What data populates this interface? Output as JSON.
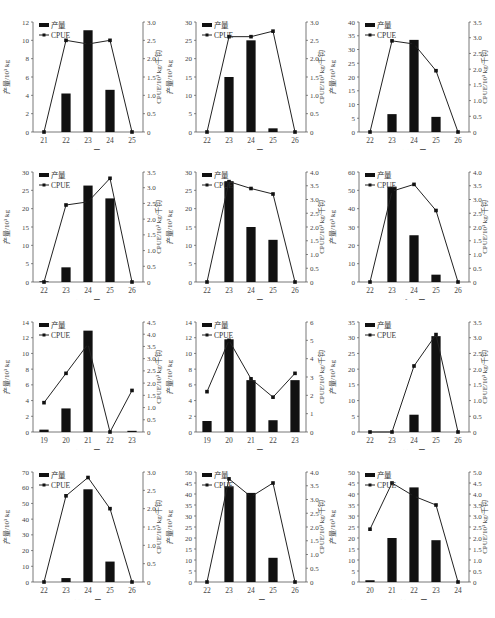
{
  "figure": {
    "left_axis_label": "产量/10³ kg",
    "right_axis_label": "CPUE/10³ kg/千钩",
    "legend": {
      "bar": "产量",
      "line": "CPUE"
    },
    "caption": ""
  },
  "chart_data": [
    {
      "type": "bar+line",
      "panel": "(a)",
      "title": "(a) 1月",
      "categories": [
        "21",
        "22",
        "23",
        "24",
        "25"
      ],
      "series": [
        {
          "name": "产量",
          "type": "bar",
          "axis": "left",
          "values": [
            0,
            4.2,
            11.1,
            4.6,
            0
          ]
        },
        {
          "name": "CPUE",
          "type": "line",
          "axis": "right",
          "values": [
            0,
            2.5,
            2.4,
            2.5,
            0
          ]
        }
      ],
      "ylim_left": [
        0,
        12
      ],
      "yticks_left": [
        0,
        2,
        4,
        6,
        8,
        10,
        12
      ],
      "ylim_right": [
        0,
        3.0
      ],
      "yticks_right": [
        0,
        0.5,
        1.0,
        1.5,
        2.0,
        2.5,
        3.0
      ],
      "ylabel_left": "产量/10³ kg",
      "ylabel_right": "CPUE/10³ kg/千钩"
    },
    {
      "type": "bar+line",
      "panel": "(b)",
      "title": "(b) 2月",
      "categories": [
        "22",
        "23",
        "24",
        "25",
        "26"
      ],
      "series": [
        {
          "name": "产量",
          "type": "bar",
          "axis": "left",
          "values": [
            0,
            15,
            25,
            1,
            0
          ]
        },
        {
          "name": "CPUE",
          "type": "line",
          "axis": "right",
          "values": [
            0,
            2.6,
            2.6,
            2.75,
            0
          ]
        }
      ],
      "ylim_left": [
        0,
        30
      ],
      "yticks_left": [
        0,
        5,
        10,
        15,
        20,
        25,
        30
      ],
      "ylim_right": [
        0,
        3.0
      ],
      "yticks_right": [
        0,
        0.5,
        1.0,
        1.5,
        2.0,
        2.5,
        3.0
      ],
      "ylabel_left": "产量/10³ kg",
      "ylabel_right": "CPUE/10³ kg/千钩"
    },
    {
      "type": "bar+line",
      "panel": "(c)",
      "title": "(c) 3月",
      "categories": [
        "22",
        "23",
        "24",
        "25",
        "26"
      ],
      "series": [
        {
          "name": "产量",
          "type": "bar",
          "axis": "left",
          "values": [
            0,
            6.5,
            33.5,
            5.5,
            0
          ]
        },
        {
          "name": "CPUE",
          "type": "line",
          "axis": "right",
          "values": [
            0,
            2.9,
            2.8,
            1.95,
            0
          ]
        }
      ],
      "ylim_left": [
        0,
        40
      ],
      "yticks_left": [
        0,
        5,
        10,
        15,
        20,
        25,
        30,
        35,
        40
      ],
      "ylim_right": [
        0,
        3.5
      ],
      "yticks_right": [
        0,
        0.5,
        1.0,
        1.5,
        2.0,
        2.5,
        3.0,
        3.5
      ],
      "ylabel_left": "产量/10³ kg",
      "ylabel_right": "CPUE/10³ kg/千钩"
    },
    {
      "type": "bar+line",
      "panel": "(d)",
      "title": "(d) 4月",
      "categories": [
        "22",
        "23",
        "24",
        "25",
        "26"
      ],
      "series": [
        {
          "name": "产量",
          "type": "bar",
          "axis": "left",
          "values": [
            0.2,
            4,
            26.3,
            22.8,
            0
          ]
        },
        {
          "name": "CPUE",
          "type": "line",
          "axis": "right",
          "values": [
            0,
            2.45,
            2.55,
            3.3,
            0
          ]
        }
      ],
      "ylim_left": [
        0,
        30
      ],
      "yticks_left": [
        0,
        5,
        10,
        15,
        20,
        25,
        30
      ],
      "ylim_right": [
        0,
        3.5
      ],
      "yticks_right": [
        0,
        0.5,
        1.0,
        1.5,
        2.0,
        2.5,
        3.0,
        3.5
      ],
      "ylabel_left": "产量/10³ kg",
      "ylabel_right": "CPUE/10³ kg/千钩"
    },
    {
      "type": "bar+line",
      "panel": "(e)",
      "title": "(e) 5月",
      "categories": [
        "22",
        "23",
        "24",
        "25",
        "26"
      ],
      "series": [
        {
          "name": "产量",
          "type": "bar",
          "axis": "left",
          "values": [
            0,
            27.5,
            15,
            11.5,
            0
          ]
        },
        {
          "name": "CPUE",
          "type": "line",
          "axis": "right",
          "values": [
            0,
            3.65,
            3.4,
            3.2,
            0
          ]
        }
      ],
      "ylim_left": [
        0,
        30
      ],
      "yticks_left": [
        0,
        5,
        10,
        15,
        20,
        25,
        30
      ],
      "ylim_right": [
        0,
        4.0
      ],
      "yticks_right": [
        0,
        0.5,
        1.0,
        1.5,
        2.0,
        2.5,
        3.0,
        3.5,
        4.0
      ],
      "ylabel_left": "产量/10³ kg",
      "ylabel_right": "CPUE/10³ kg/千钩"
    },
    {
      "type": "bar+line",
      "panel": "(f)",
      "title": "(f) 6月",
      "categories": [
        "22",
        "23",
        "24",
        "25",
        "26"
      ],
      "series": [
        {
          "name": "产量",
          "type": "bar",
          "axis": "left",
          "values": [
            0,
            52,
            25.5,
            4,
            0
          ]
        },
        {
          "name": "CPUE",
          "type": "line",
          "axis": "right",
          "values": [
            0,
            3.3,
            3.55,
            2.6,
            0
          ]
        }
      ],
      "ylim_left": [
        0,
        60
      ],
      "yticks_left": [
        0,
        10,
        20,
        30,
        40,
        50,
        60
      ],
      "ylim_right": [
        0,
        4.0
      ],
      "yticks_right": [
        0,
        0.5,
        1.0,
        1.5,
        2.0,
        2.5,
        3.0,
        3.5,
        4.0
      ],
      "ylabel_left": "产量/10³ kg",
      "ylabel_right": "CPUE/10³ kg/千钩"
    },
    {
      "type": "bar+line",
      "panel": "(g)",
      "title": "(g) 7月",
      "categories": [
        "19",
        "20",
        "21",
        "22",
        "23"
      ],
      "series": [
        {
          "name": "产量",
          "type": "bar",
          "axis": "left",
          "values": [
            0.3,
            3,
            12.9,
            0,
            0.15
          ]
        },
        {
          "name": "CPUE",
          "type": "line",
          "axis": "right",
          "values": [
            1.2,
            2.4,
            3.6,
            0,
            1.7
          ]
        }
      ],
      "ylim_left": [
        0,
        14
      ],
      "yticks_left": [
        0,
        2,
        4,
        6,
        8,
        10,
        12,
        14
      ],
      "ylim_right": [
        0,
        4.5
      ],
      "yticks_right": [
        0,
        0.5,
        1.0,
        1.5,
        2.0,
        2.5,
        3.0,
        3.5,
        4.0,
        4.5
      ],
      "ylabel_left": "产量/10³ kg",
      "ylabel_right": "CPUE/10³ kg/千钩"
    },
    {
      "type": "bar+line",
      "panel": "(h)",
      "title": "(h) 8月",
      "categories": [
        "19",
        "20",
        "21",
        "22",
        "23"
      ],
      "series": [
        {
          "name": "产量",
          "type": "bar",
          "axis": "left",
          "values": [
            1.4,
            11.8,
            6.6,
            1.5,
            6.6
          ]
        },
        {
          "name": "CPUE",
          "type": "line",
          "axis": "right",
          "values": [
            2.2,
            5.0,
            2.9,
            1.9,
            3.2
          ]
        }
      ],
      "ylim_left": [
        0,
        14
      ],
      "yticks_left": [
        0,
        2,
        4,
        6,
        8,
        10,
        12,
        14
      ],
      "ylim_right": [
        0,
        6
      ],
      "yticks_right": [
        0,
        1,
        2,
        3,
        4,
        5,
        6
      ],
      "ylabel_left": "产量/10³ kg",
      "ylabel_right": "CPUE/10³ kg/千钩"
    },
    {
      "type": "bar+line",
      "panel": "(i)",
      "title": "(i) 9月",
      "categories": [
        "22",
        "23",
        "24",
        "25",
        "26"
      ],
      "series": [
        {
          "name": "产量",
          "type": "bar",
          "axis": "left",
          "values": [
            0,
            0,
            5.5,
            30.5,
            0
          ]
        },
        {
          "name": "CPUE",
          "type": "line",
          "axis": "right",
          "values": [
            0,
            0,
            2.1,
            3.1,
            0
          ]
        }
      ],
      "ylim_left": [
        0,
        35
      ],
      "yticks_left": [
        0,
        5,
        10,
        15,
        20,
        25,
        30,
        35
      ],
      "ylim_right": [
        0,
        3.5
      ],
      "yticks_right": [
        0,
        0.5,
        1.0,
        1.5,
        2.0,
        2.5,
        3.0,
        3.5
      ],
      "ylabel_left": "产量/10³ kg",
      "ylabel_right": "CPUE/10³ kg/千钩"
    },
    {
      "type": "bar+line",
      "panel": "(j)",
      "title": "(j) 10月",
      "categories": [
        "22",
        "23",
        "24",
        "25",
        "26"
      ],
      "series": [
        {
          "name": "产量",
          "type": "bar",
          "axis": "left",
          "values": [
            0,
            2.5,
            59,
            13,
            0
          ]
        },
        {
          "name": "CPUE",
          "type": "line",
          "axis": "right",
          "values": [
            0,
            2.35,
            2.85,
            2.0,
            0
          ]
        }
      ],
      "ylim_left": [
        0,
        70
      ],
      "yticks_left": [
        0,
        10,
        20,
        30,
        40,
        50,
        60,
        70
      ],
      "ylim_right": [
        0,
        3.0
      ],
      "yticks_right": [
        0,
        0.5,
        1.0,
        1.5,
        2.0,
        2.5,
        3.0
      ],
      "ylabel_left": "产量/10³ kg",
      "ylabel_right": "CPUE/10³ kg/千钩"
    },
    {
      "type": "bar+line",
      "panel": "(k)",
      "title": "(k) 11月",
      "categories": [
        "22",
        "23",
        "24",
        "25",
        "26"
      ],
      "series": [
        {
          "name": "产量",
          "type": "bar",
          "axis": "left",
          "values": [
            0,
            43.5,
            40.5,
            11,
            0
          ]
        },
        {
          "name": "CPUE",
          "type": "line",
          "axis": "right",
          "values": [
            0,
            3.75,
            3.1,
            3.6,
            0
          ]
        }
      ],
      "ylim_left": [
        0,
        50
      ],
      "yticks_left": [
        0,
        5,
        10,
        15,
        20,
        25,
        30,
        35,
        40,
        45,
        50
      ],
      "ylim_right": [
        0,
        4.0
      ],
      "yticks_right": [
        0,
        0.5,
        1.0,
        1.5,
        2.0,
        2.5,
        3.0,
        3.5,
        4.0
      ],
      "ylabel_left": "产量/10³ kg",
      "ylabel_right": "CPUE/10³ kg/千钩"
    },
    {
      "type": "bar+line",
      "panel": "(l)",
      "title": "(l) 12月",
      "categories": [
        "20",
        "21",
        "22",
        "23",
        "24"
      ],
      "series": [
        {
          "name": "产量",
          "type": "bar",
          "axis": "left",
          "values": [
            0.8,
            20,
            43,
            19,
            0
          ]
        },
        {
          "name": "CPUE",
          "type": "line",
          "axis": "right",
          "values": [
            2.4,
            4.5,
            3.9,
            3.5,
            0
          ]
        }
      ],
      "ylim_left": [
        0,
        50
      ],
      "yticks_left": [
        0,
        5,
        10,
        15,
        20,
        25,
        30,
        35,
        40,
        45,
        50
      ],
      "ylim_right": [
        0,
        5.0
      ],
      "yticks_right": [
        0,
        0.5,
        1.0,
        1.5,
        2.0,
        2.5,
        3.0,
        3.5,
        4.0,
        4.5,
        5.0
      ],
      "ylabel_left": "产量/10³ kg",
      "ylabel_right": "CPUE/10³ kg/千钩"
    }
  ]
}
